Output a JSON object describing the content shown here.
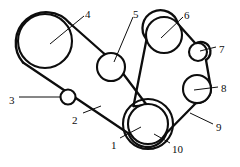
{
  "diagram": {
    "type": "line-drawing",
    "background_color": "#ffffff",
    "stroke_color": "#0d0d0d",
    "width": 240,
    "height": 167,
    "callouts": [
      {
        "id": "1",
        "label": "1",
        "x": 111,
        "y": 140,
        "target": "crankshaft-pulley"
      },
      {
        "id": "2",
        "label": "2",
        "x": 72,
        "y": 115,
        "target": "belt-lower-left-run"
      },
      {
        "id": "3",
        "label": "3",
        "x": 9,
        "y": 95,
        "target": "idler-pulley-small-left"
      },
      {
        "id": "4",
        "label": "4",
        "x": 85,
        "y": 9,
        "target": "large-pulley-upper-left"
      },
      {
        "id": "5",
        "label": "5",
        "x": 133,
        "y": 9,
        "target": "idler-pulley-center"
      },
      {
        "id": "6",
        "label": "6",
        "x": 184,
        "y": 10,
        "target": "pulley-upper-right"
      },
      {
        "id": "7",
        "label": "7",
        "x": 219,
        "y": 44,
        "target": "idler-pulley-small-right"
      },
      {
        "id": "8",
        "label": "8",
        "x": 221,
        "y": 83,
        "target": "pulley-right"
      },
      {
        "id": "9",
        "label": "9",
        "x": 216,
        "y": 122,
        "target": "belt-lower-right-run"
      },
      {
        "id": "10",
        "label": "10",
        "x": 172,
        "y": 144,
        "target": "crankshaft-pulley-outer-ring"
      }
    ],
    "pulleys": [
      {
        "name": "large-pulley-upper-left",
        "callout": "4",
        "cx": 45,
        "cy": 41,
        "r": 27
      },
      {
        "name": "idler-pulley-small-left",
        "callout": "3",
        "cx": 68,
        "cy": 97,
        "r": 7.5
      },
      {
        "name": "idler-pulley-center",
        "callout": "5",
        "cx": 111,
        "cy": 67,
        "r": 14
      },
      {
        "name": "pulley-upper-right",
        "callout": "6",
        "cx": 164,
        "cy": 35,
        "r": 18
      },
      {
        "name": "idler-pulley-small-right",
        "callout": "7",
        "cx": 198,
        "cy": 52,
        "r": 9
      },
      {
        "name": "pulley-right",
        "callout": "8",
        "cx": 197,
        "cy": 89,
        "r": 14
      },
      {
        "name": "crankshaft-pulley",
        "callout": "1",
        "cx": 148,
        "cy": 124,
        "r": 20
      },
      {
        "name": "crankshaft-pulley-outer-ring",
        "callout": "10",
        "cx": 148,
        "cy": 124,
        "r": 25
      }
    ]
  }
}
